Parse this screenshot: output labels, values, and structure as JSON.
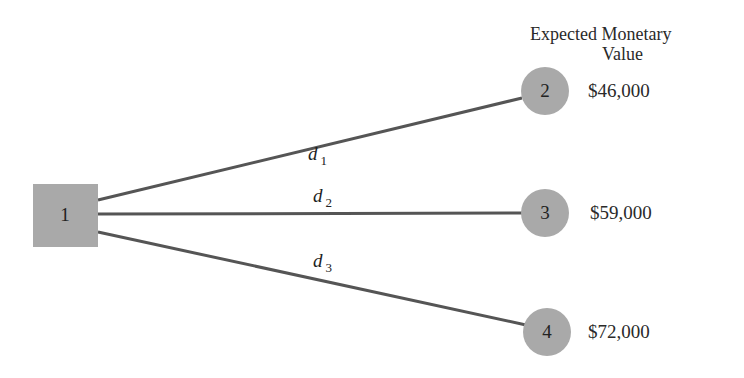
{
  "header": {
    "line1": "Expected Monetary",
    "line2": "Value"
  },
  "decision_node": {
    "id": "1",
    "shape": "square",
    "color": "#a9a9a9"
  },
  "branches": [
    {
      "label": "d",
      "sub": "1",
      "to": "2",
      "value": "$46,000"
    },
    {
      "label": "d",
      "sub": "2",
      "to": "3",
      "value": "$59,000"
    },
    {
      "label": "d",
      "sub": "3",
      "to": "4",
      "value": "$72,000"
    }
  ],
  "outcome_nodes": [
    {
      "id": "2",
      "shape": "circle"
    },
    {
      "id": "3",
      "shape": "circle"
    },
    {
      "id": "4",
      "shape": "circle"
    }
  ],
  "colors": {
    "node_fill": "#a9a9a9",
    "line": "#555555",
    "text": "#222222"
  }
}
